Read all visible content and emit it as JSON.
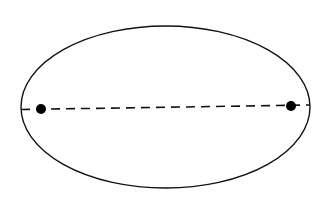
{
  "diagram": {
    "title": "",
    "background": "#ffffff",
    "stroke_color": "#111111",
    "ellipse": {
      "cx": 165.5,
      "cy": 107,
      "rx": 144.5,
      "ry": 81
    },
    "major_axis": {
      "x1": 21,
      "y1": 109.5,
      "x2": 310,
      "y2": 105,
      "style": "dashed"
    },
    "foci": [
      {
        "label": "",
        "x": 41,
        "y": 109,
        "r": 5
      },
      {
        "label": "",
        "x": 291,
        "y": 106,
        "r": 5
      }
    ]
  }
}
